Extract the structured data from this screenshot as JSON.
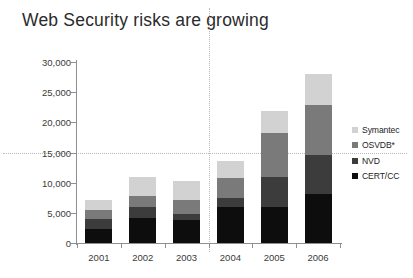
{
  "chart_data": {
    "type": "bar",
    "title": "Web Security risks are growing",
    "xlabel": "",
    "ylabel": "",
    "categories": [
      "2001",
      "2002",
      "2003",
      "2004",
      "2005",
      "2006"
    ],
    "series": [
      {
        "name": "CERT/CC",
        "color": "#0d0d0d",
        "values": [
          2400,
          4100,
          3800,
          5900,
          5900,
          8100
        ]
      },
      {
        "name": "NVD",
        "color": "#3c3c3c",
        "values": [
          1500,
          1900,
          1000,
          1600,
          5100,
          6500
        ]
      },
      {
        "name": "OSVDB*",
        "color": "#7a7a7a",
        "values": [
          1500,
          1800,
          2400,
          3200,
          7200,
          8300
        ]
      },
      {
        "name": "Symantec",
        "color": "#d2d2d2",
        "values": [
          1800,
          3100,
          3000,
          2900,
          3600,
          5100
        ]
      }
    ],
    "totals": [
      7200,
      10900,
      10200,
      13600,
      21800,
      28000
    ],
    "ylim": [
      0,
      30000
    ],
    "ytick_values": [
      0,
      5000,
      10000,
      15000,
      20000,
      25000,
      30000
    ],
    "ytick_labels": [
      "0",
      "5,000",
      "10,000",
      "15,000",
      "20,000",
      "25,000",
      "30,000"
    ],
    "grid": "dotted-horizontal-at-15000",
    "legend_position": "right",
    "legend_entries": [
      "Symantec",
      "OSVDB*",
      "NVD",
      "CERT/CC"
    ],
    "annotations": {
      "vertical_divider_between": [
        "2003",
        "2004"
      ]
    },
    "colors": {
      "axis": "#8f8f8f",
      "grid": "#b9b9b9",
      "title_text": "#2b2b2b",
      "tick_text": "#3a3a3a",
      "background": "#ffffff"
    }
  }
}
